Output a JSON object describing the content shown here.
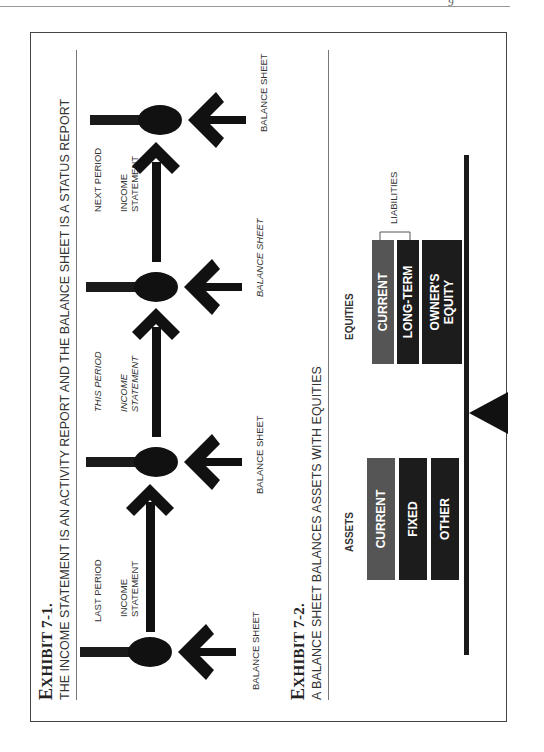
{
  "page": {
    "mark": "9"
  },
  "exhibit1": {
    "label_prefix": "E",
    "label_rest": "XHIBIT 7-1.",
    "subtitle": "THE INCOME STATEMENT IS AN ACTIVITY REPORT AND THE BALANCE SHEET IS A STATUS REPORT",
    "periods": [
      {
        "period": "LAST PERIOD",
        "statement": "INCOME\nSTATEMENT",
        "italic": false
      },
      {
        "period": "THIS PERIOD",
        "statement": "INCOME\nSTATEMENT",
        "italic": true
      },
      {
        "period": "NEXT PERIOD",
        "statement": "INCOME\nSTATEMENT",
        "italic": false
      }
    ],
    "balance_sheets": [
      "BALANCE SHEET",
      "BALANCE SHEET",
      "BALANCE SHEET",
      "BALANCE SHEET"
    ]
  },
  "exhibit2": {
    "label_prefix": "E",
    "label_rest": "XHIBIT 7-2.",
    "subtitle": "A BALANCE SHEET BALANCES ASSETS WITH EQUITIES",
    "assets": {
      "heading": "ASSETS",
      "items": [
        "CURRENT",
        "FIXED",
        "OTHER"
      ]
    },
    "equities": {
      "heading": "EQUITIES",
      "items": [
        "CURRENT",
        "LONG-TERM",
        "OWNER'S\nEQUITY"
      ],
      "bracket_label": "LIABILITIES"
    },
    "colors": {
      "current": "#555555",
      "dark": "#1c1c1c"
    }
  }
}
